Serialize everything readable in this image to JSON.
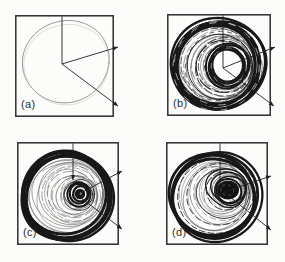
{
  "figure": {
    "paper_color": "#fcfcfa",
    "ink_color": "#181818",
    "frame_color": "#2e2e2e",
    "axis_color": "#202020",
    "thin_line_color": "#8f8f8f",
    "panels": [
      {
        "id": "a",
        "label": "(a)",
        "attractor": "thin-limit-cycle",
        "axes": "3d-phase-axes"
      },
      {
        "id": "b",
        "label": "(b)",
        "attractor": "thick-torus-band",
        "axes": "3d-phase-axes"
      },
      {
        "id": "c",
        "label": "(c)",
        "attractor": "spiral-attractor-dense-core",
        "axes": "3d-phase-axes"
      },
      {
        "id": "d",
        "label": "(d)",
        "attractor": "spiral-attractor-large-dark-core",
        "axes": "3d-phase-axes"
      }
    ]
  }
}
